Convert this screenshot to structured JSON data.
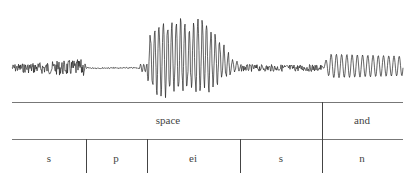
{
  "diagram": {
    "type": "speech-waveform-segmentation",
    "waveform_segments": [
      {
        "phone": "s",
        "kind": "noise"
      },
      {
        "phone": "p",
        "kind": "closure"
      },
      {
        "phone": "ei",
        "kind": "voiced-periodic"
      },
      {
        "phone": "s",
        "kind": "noise"
      },
      {
        "phone": "n",
        "kind": "voiced-periodic"
      }
    ],
    "word_tier": [
      {
        "label": "space",
        "x_start": 12,
        "x_end": 322
      },
      {
        "label": "and",
        "x_start": 322,
        "x_end": 403
      }
    ],
    "phone_tier": [
      {
        "label": "s",
        "x_start": 12,
        "x_end": 86
      },
      {
        "label": "p",
        "x_start": 86,
        "x_end": 147
      },
      {
        "label": "ei",
        "x_start": 147,
        "x_end": 240
      },
      {
        "label": "s",
        "x_start": 240,
        "x_end": 322
      },
      {
        "label": "n",
        "x_start": 322,
        "x_end": 403
      }
    ]
  }
}
